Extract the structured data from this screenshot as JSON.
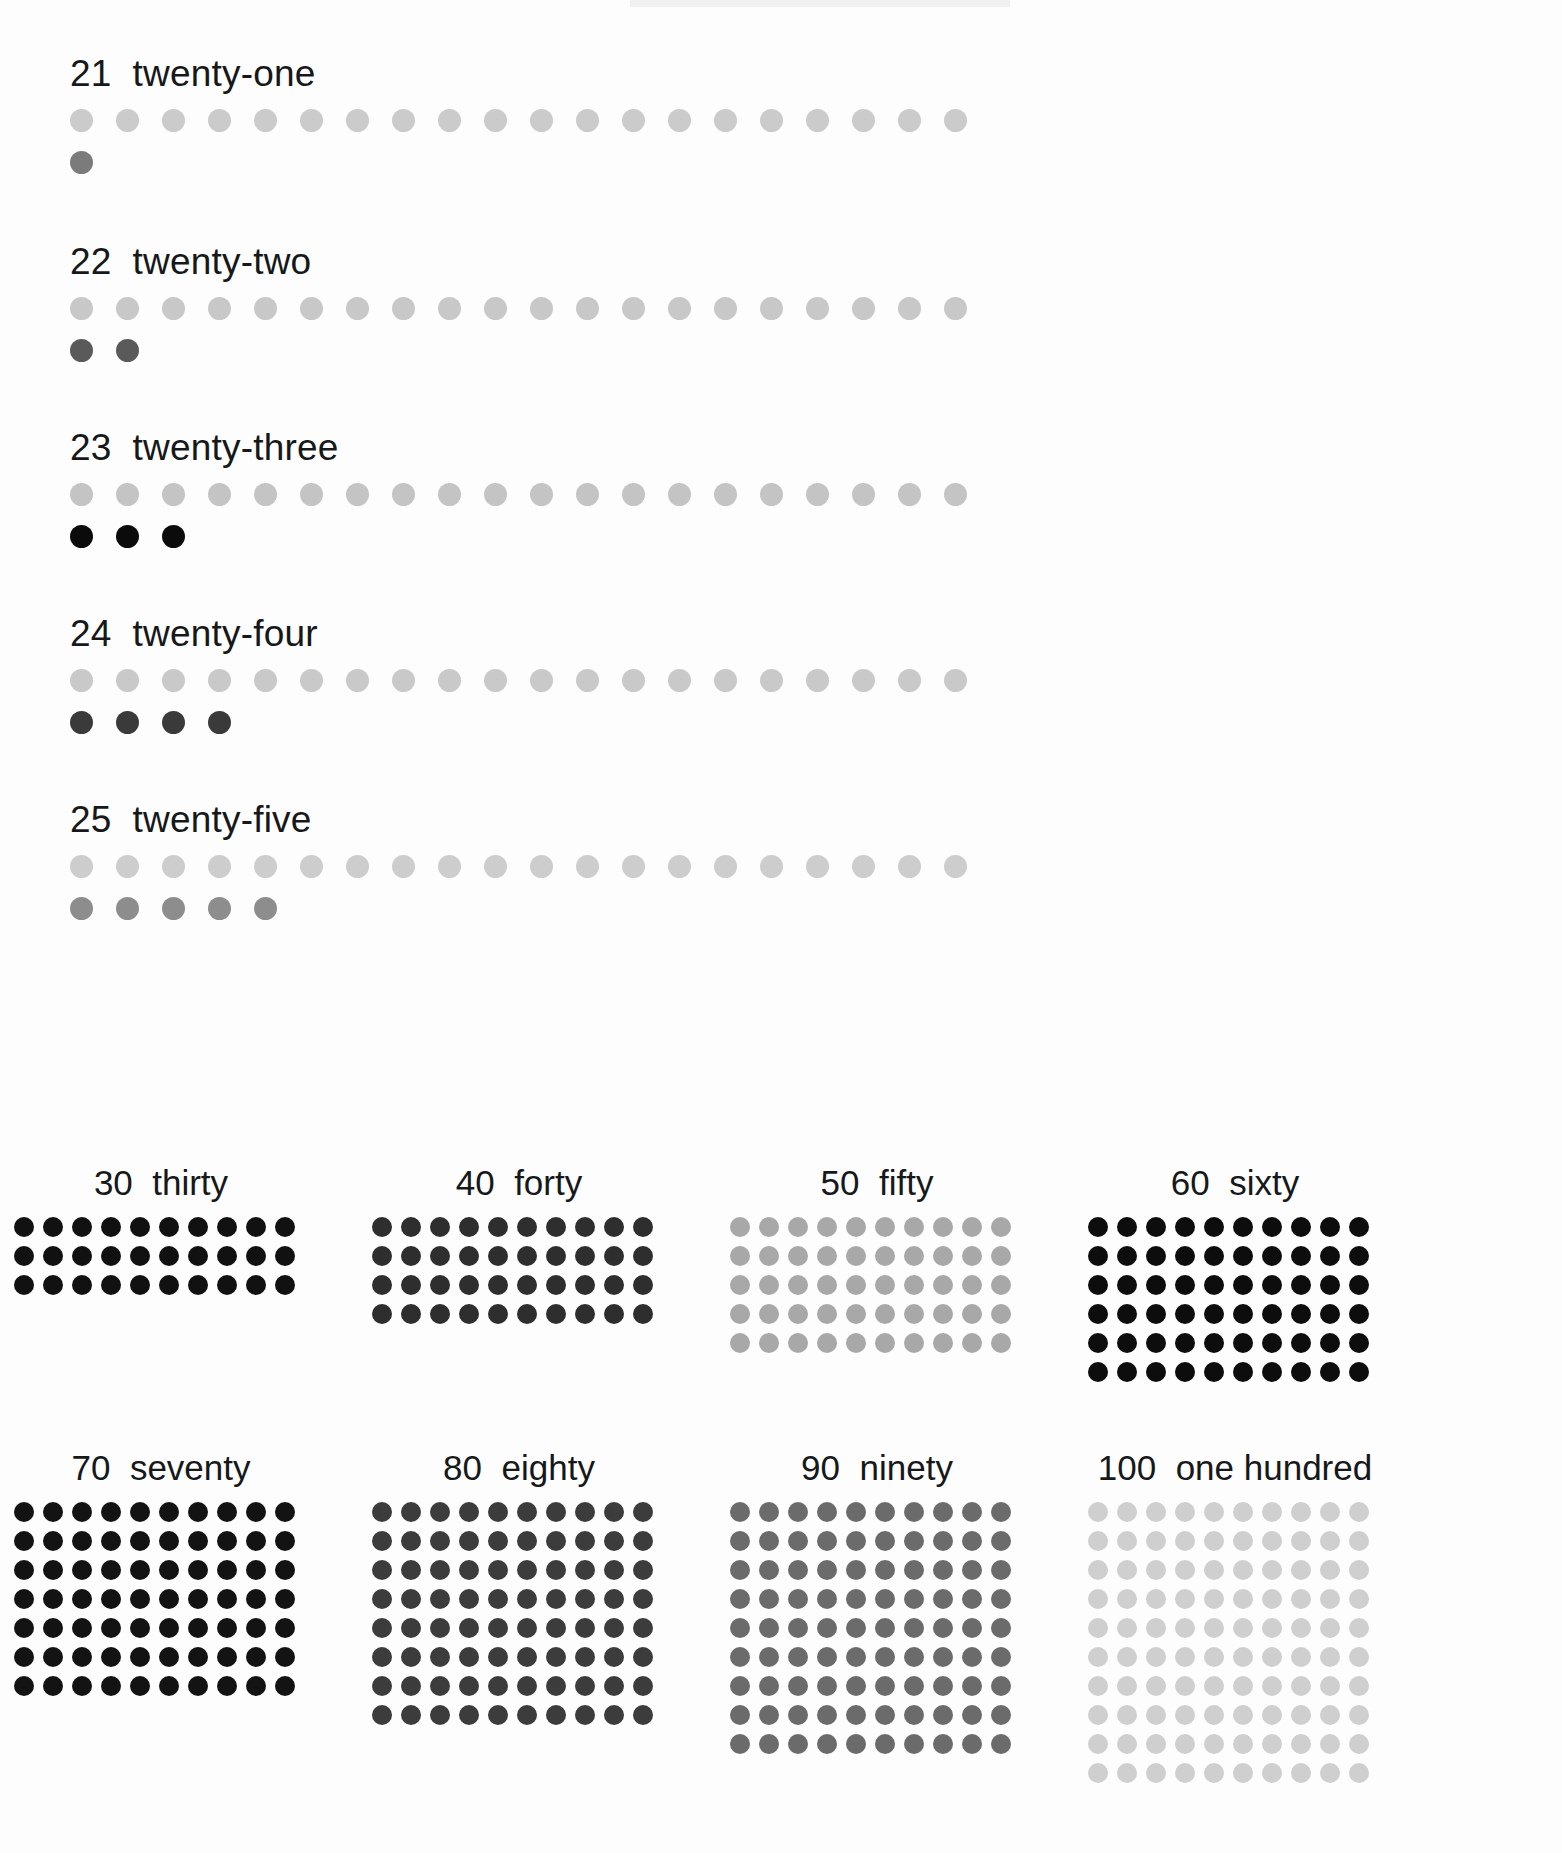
{
  "document": {
    "kind": "counting-chart",
    "title_visible": false
  },
  "teens_section": {
    "rows": [
      {
        "number": "21",
        "word": "twenty-one",
        "label": "21  twenty-one",
        "total": 21,
        "base_row_count": 20,
        "remainder_count": 1,
        "base_color": "#cbcbcb",
        "remainder_color": "#7b7b7b"
      },
      {
        "number": "22",
        "word": "twenty-two",
        "label": "22  twenty-two",
        "total": 22,
        "base_row_count": 20,
        "remainder_count": 2,
        "base_color": "#c8c8c8",
        "remainder_color": "#5a5a5a"
      },
      {
        "number": "23",
        "word": "twenty-three",
        "label": "23  twenty-three",
        "total": 23,
        "base_row_count": 20,
        "remainder_count": 3,
        "base_color": "#c4c4c4",
        "remainder_color": "#0b0b0b"
      },
      {
        "number": "24",
        "word": "twenty-four",
        "label": "24  twenty-four",
        "total": 24,
        "base_row_count": 20,
        "remainder_count": 4,
        "base_color": "#c9c9c9",
        "remainder_color": "#3a3a3a"
      },
      {
        "number": "25",
        "word": "twenty-five",
        "label": "25  twenty-five",
        "total": 25,
        "base_row_count": 20,
        "remainder_count": 5,
        "base_color": "#cdcdcd",
        "remainder_color": "#8d8d8d"
      }
    ]
  },
  "decades_section": {
    "columns_per_row": 10,
    "bands": [
      {
        "blocks": [
          {
            "number": "30",
            "word": "thirty",
            "label": "30  thirty",
            "total": 30,
            "rows": 3,
            "color": "#111111"
          },
          {
            "number": "40",
            "word": "forty",
            "label": "40  forty",
            "total": 40,
            "rows": 4,
            "color": "#2e2e2e"
          },
          {
            "number": "50",
            "word": "fifty",
            "label": "50  fifty",
            "total": 50,
            "rows": 5,
            "color": "#a8a8a8"
          },
          {
            "number": "60",
            "word": "sixty",
            "label": "60  sixty",
            "total": 60,
            "rows": 6,
            "color": "#0d0d0d"
          }
        ]
      },
      {
        "blocks": [
          {
            "number": "70",
            "word": "seventy",
            "label": "70  seventy",
            "total": 70,
            "rows": 7,
            "color": "#131313"
          },
          {
            "number": "80",
            "word": "eighty",
            "label": "80  eighty",
            "total": 80,
            "rows": 8,
            "color": "#3c3c3c"
          },
          {
            "number": "90",
            "word": "ninety",
            "label": "90  ninety",
            "total": 90,
            "rows": 9,
            "color": "#6b6b6b"
          },
          {
            "number": "100",
            "word": "one hundred",
            "label": "100  one hundred",
            "total": 100,
            "rows": 10,
            "color": "#cfcfcf"
          }
        ]
      }
    ]
  },
  "chart_data": {
    "type": "bar",
    "xlabel": "",
    "ylabel": "Quantity (dots)",
    "categories": [
      "21",
      "22",
      "23",
      "24",
      "25",
      "30",
      "40",
      "50",
      "60",
      "70",
      "80",
      "90",
      "100"
    ],
    "values": [
      21,
      22,
      23,
      24,
      25,
      30,
      40,
      50,
      60,
      70,
      80,
      90,
      100
    ],
    "tick_labels": [
      "twenty-one",
      "twenty-two",
      "twenty-three",
      "twenty-four",
      "twenty-five",
      "thirty",
      "forty",
      "fifty",
      "sixty",
      "seventy",
      "eighty",
      "ninety",
      "one hundred"
    ],
    "ylim": [
      0,
      100
    ],
    "grid": false,
    "legend": false
  }
}
